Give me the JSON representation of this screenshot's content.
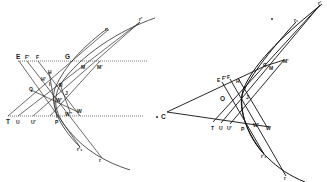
{
  "figures": {
    "left": {
      "labels": {
        "E": "E",
        "F_prime": "F'",
        "F": "F",
        "G": "G",
        "M": "M",
        "M_prime": "M'",
        "H": "H",
        "H_prime": "H'",
        "I": "I",
        "R": "R",
        "Q": "Q",
        "J": "J",
        "W_prime": "W'",
        "W": "W",
        "W_dprime": "W''",
        "T": "T",
        "U": "U",
        "U_prime": "U'",
        "P": "P",
        "r1": "r₁",
        "r_prime": "r'",
        "r_prime1": "r'₁",
        "r": "r"
      }
    },
    "right": {
      "labels": {
        "C": "C",
        "E": "E",
        "F_prime": "F'",
        "F": "F",
        "G": "G",
        "M": "M",
        "M_prime": "M'",
        "H": "H",
        "O": "O",
        "J": "J",
        "T": "T",
        "U": "U",
        "U_prime": "U'",
        "P": "P",
        "W_prime": "W'",
        "W": "W",
        "r1": "r₁",
        "r_prime": "r'",
        "r_prime1": "r'₁",
        "r": "r"
      }
    }
  },
  "colors": {
    "ink": "#1a1a1a",
    "background": "#ffffff"
  }
}
